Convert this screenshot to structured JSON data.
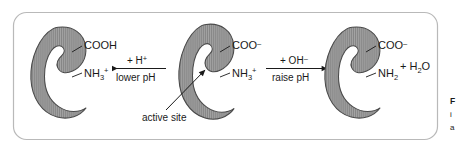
{
  "figure": {
    "type": "biochemistry-diagram",
    "panel": {
      "border_color": "#b9b9b9",
      "background": "#ffffff"
    },
    "enzyme": {
      "shape_name": "kidney-bean-enzyme",
      "fill_color": "#9a9a9a",
      "hatch_color": "#7a7a7a",
      "outline_color": "#4a4a4a"
    },
    "states": [
      {
        "id": "low-ph-state",
        "position": "left",
        "group_top": {
          "main": "COOH",
          "sub": "",
          "sup": ""
        },
        "group_bottom": {
          "main": "NH",
          "sub": "3",
          "sup": "+"
        }
      },
      {
        "id": "neutral-ph-state",
        "position": "center",
        "group_top": {
          "main": "COO",
          "sub": "",
          "sup": "–"
        },
        "group_bottom": {
          "main": "NH",
          "sub": "3",
          "sup": "+"
        }
      },
      {
        "id": "high-ph-state",
        "position": "right",
        "group_top": {
          "main": "COO",
          "sub": "",
          "sup": "–"
        },
        "group_bottom": {
          "main": "NH",
          "sub": "2",
          "sup": ""
        }
      }
    ],
    "reactions": [
      {
        "id": "protonation-arrow",
        "direction": "left",
        "above": {
          "main": "+ H",
          "sup": "+"
        },
        "below": "lower pH"
      },
      {
        "id": "deprotonation-arrow",
        "direction": "right",
        "above": {
          "main": "+ OH",
          "sup": "–"
        },
        "below": "raise pH"
      }
    ],
    "byproduct": {
      "id": "water-product",
      "main": "+ H",
      "sub": "2",
      "tail": "O"
    },
    "callout": {
      "id": "active-site-callout",
      "label": "active site"
    },
    "caption_fragment": {
      "line1": "F",
      "line2": "i",
      "line3": "a"
    }
  }
}
